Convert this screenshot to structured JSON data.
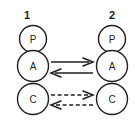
{
  "diagram": {
    "type": "two-column-node-interaction-diagram",
    "background_color": "#ffffff",
    "stroke_color": "#231f20",
    "columns": [
      {
        "id": "column-1",
        "label": "1",
        "label_x": 27,
        "label_y": 18,
        "center_x": 33,
        "nodes": [
          {
            "id": "col1-node-p",
            "label": "P",
            "cx": 33,
            "cy": 39,
            "r": 14
          },
          {
            "id": "col1-node-a",
            "label": "A",
            "cx": 33,
            "cy": 66,
            "r": 16
          },
          {
            "id": "col1-node-c",
            "label": "C",
            "cx": 33,
            "cy": 99,
            "r": 16
          }
        ]
      },
      {
        "id": "column-2",
        "label": "2",
        "label_x": 112,
        "label_y": 18,
        "center_x": 112,
        "nodes": [
          {
            "id": "col2-node-p",
            "label": "P",
            "cx": 112,
            "cy": 39,
            "r": 14
          },
          {
            "id": "col2-node-a",
            "label": "A",
            "cx": 112,
            "cy": 66,
            "r": 16
          },
          {
            "id": "col2-node-c",
            "label": "C",
            "cx": 112,
            "cy": 99,
            "r": 16
          }
        ]
      }
    ],
    "edges": [
      {
        "id": "edge-a-forward",
        "from": "col1-node-a",
        "to": "col2-node-a",
        "direction": "right",
        "style": "solid",
        "x1": 51,
        "x2": 93,
        "y": 62
      },
      {
        "id": "edge-a-reverse",
        "from": "col2-node-a",
        "to": "col1-node-a",
        "direction": "left",
        "style": "solid",
        "x1": 93,
        "x2": 51,
        "y": 73
      },
      {
        "id": "edge-c-forward",
        "from": "col1-node-c",
        "to": "col2-node-c",
        "direction": "right",
        "style": "dashed",
        "x1": 51,
        "x2": 93,
        "y": 95
      },
      {
        "id": "edge-c-reverse",
        "from": "col2-node-c",
        "to": "col1-node-c",
        "direction": "left",
        "style": "dashed",
        "x1": 93,
        "x2": 51,
        "y": 105
      }
    ]
  }
}
